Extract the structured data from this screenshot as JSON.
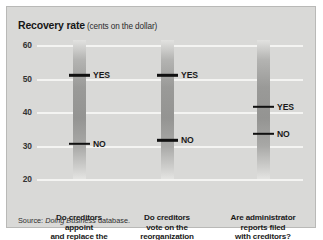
{
  "title": {
    "main": "Recovery rate",
    "sub": "(cents on the dollar)"
  },
  "source": {
    "prefix": "Source:",
    "work": "Doing Business",
    "suffix": "database."
  },
  "colors": {
    "panel_background": "#d9d9d7",
    "panel_border": "#b9b9b7",
    "gridline": "#f4f4f2",
    "marker": "#111111",
    "text": "#1a1a1a",
    "bar_light": "#e2e2e0",
    "bar_dark": "#949492"
  },
  "chart_data": {
    "type": "bar",
    "xlabel": "",
    "ylabel": "Recovery rate (cents on the dollar)",
    "ylim": [
      20,
      60
    ],
    "yticks": [
      60,
      50,
      40,
      30,
      20
    ],
    "ytick_labels": [
      "60",
      "50",
      "40",
      "30",
      "20"
    ],
    "grid": true,
    "legend": "none",
    "categories": [
      "Do creditors appoint and replace the administrator?",
      "Do creditors vote on the reorganization plan?",
      "Are administrator reports filed with creditors?"
    ],
    "category_lines": [
      [
        "Do creditors",
        "appoint",
        "and replace the",
        "administrator?"
      ],
      [
        "Do creditors",
        "vote on the",
        "reorganization",
        "plan?"
      ],
      [
        "Are administrator",
        "reports filed",
        "with creditors?"
      ]
    ],
    "series": [
      {
        "name": "YES",
        "values": [
          51.0,
          51.0,
          41.5
        ]
      },
      {
        "name": "NO",
        "values": [
          30.5,
          31.5,
          33.5
        ]
      }
    ],
    "markers": [
      {
        "category_index": 0,
        "label": "YES",
        "value": 51.0
      },
      {
        "category_index": 0,
        "label": "NO",
        "value": 30.5
      },
      {
        "category_index": 1,
        "label": "YES",
        "value": 51.0
      },
      {
        "category_index": 1,
        "label": "NO",
        "value": 31.5
      },
      {
        "category_index": 2,
        "label": "YES",
        "value": 41.5
      },
      {
        "category_index": 2,
        "label": "NO",
        "value": 33.5
      }
    ]
  }
}
